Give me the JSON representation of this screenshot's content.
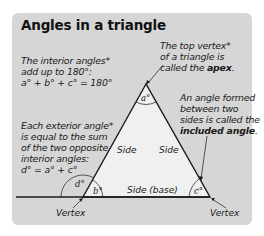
{
  "title": "Angles in a triangle",
  "notes": {
    "interior_sum": {
      "lines": [
        "The interior angles*",
        "add up to 180°:",
        "a° + b° + c° = 180°"
      ]
    },
    "apex": {
      "line1": "The top vertex*",
      "line2": "of a triangle is",
      "line3_prefix": "called the ",
      "line3_bold": "apex",
      "line3_suffix": "."
    },
    "included_angle": {
      "line1": "An angle formed",
      "line2": "between two",
      "line3": "sides is called the",
      "line4_bold": "included angle",
      "line4_suffix": "."
    },
    "exterior": {
      "lines": [
        "Each exterior angle*",
        "is equal to the sum",
        "of the two opposite",
        "interior angles:",
        "d° = a° + c°"
      ]
    }
  },
  "diagram": {
    "side_left": "Side",
    "side_right": "Side",
    "side_base": "Side (base)",
    "angle_a": "a°",
    "angle_b": "b°",
    "angle_c": "c°",
    "angle_d": "d°",
    "vertex_left": "Vertex",
    "vertex_right": "Vertex"
  },
  "colors": {
    "panel": "#d6d6d6",
    "triangle_fill": "#f0f0f0",
    "line": "#1a1a1a"
  }
}
